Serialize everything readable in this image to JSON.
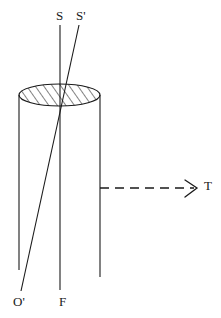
{
  "figure": {
    "type": "optics-ray-diagram",
    "background_color": "#ffffff",
    "stroke_color": "#1a1a1a",
    "width": 221,
    "height": 318
  },
  "labels": {
    "source_axis": "S",
    "source_ray": "S'",
    "transmission": "T",
    "image_point": "O'",
    "focus": "F"
  },
  "geometry": {
    "cylinder": {
      "left_wall_x": 19,
      "right_wall_x": 100,
      "top_center_y": 95,
      "left_wall_bottom_y": 270,
      "right_wall_bottom_y": 277,
      "ellipse_rx": 40.5,
      "ellipse_ry": 11,
      "hatch_angle_deg": 35
    },
    "ray_S": {
      "x1": 60,
      "y1": 25,
      "x2": 60,
      "y2": 290
    },
    "ray_S_prime": {
      "x1": 79,
      "y1": 25,
      "x2": 21,
      "y2": 291
    },
    "arrow_T": {
      "x1": 100,
      "y1": 188,
      "x2": 196,
      "y2": 188,
      "dashed": true
    }
  }
}
